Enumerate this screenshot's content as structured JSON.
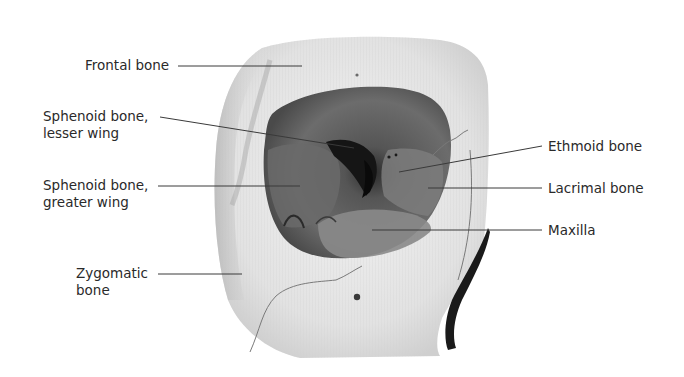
{
  "diagram": {
    "colors": {
      "background": "#ffffff",
      "bone": "#e9e9e9",
      "bone_shadow": "#bdbdbd",
      "orbit_cavity": "#5e5e5e",
      "orbit_deep": "#1e1e1e",
      "leader_line": "#3a3a3a",
      "label_text": "#2a2a2a"
    },
    "labels": [
      {
        "id": "frontal",
        "lines": [
          "Frontal bone"
        ],
        "side": "left"
      },
      {
        "id": "sphenoid-lesser",
        "lines": [
          "Sphenoid bone,",
          "lesser wing"
        ],
        "side": "left"
      },
      {
        "id": "sphenoid-greater",
        "lines": [
          "Sphenoid bone,",
          "greater wing"
        ],
        "side": "left"
      },
      {
        "id": "zygomatic",
        "lines": [
          "Zygomatic",
          "bone"
        ],
        "side": "left"
      },
      {
        "id": "ethmoid",
        "lines": [
          "Ethmoid bone"
        ],
        "side": "right"
      },
      {
        "id": "lacrimal",
        "lines": [
          "Lacrimal bone"
        ],
        "side": "right"
      },
      {
        "id": "maxilla",
        "lines": [
          "Maxilla"
        ],
        "side": "right"
      }
    ]
  }
}
